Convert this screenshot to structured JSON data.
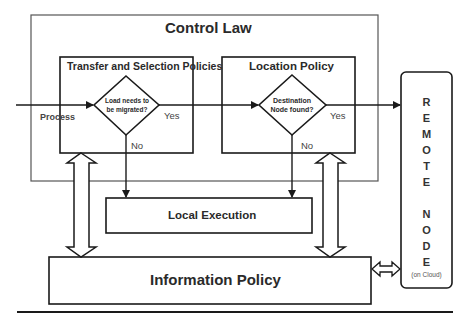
{
  "diagram": {
    "control_law": {
      "title": "Control Law"
    },
    "transfer_selection": {
      "title": "Transfer and Selection Policies",
      "decision": "Load needs to be migrated?",
      "yes_label": "Yes",
      "no_label": "No"
    },
    "location_policy": {
      "title": "Location Policy",
      "decision": "Destination Node found?",
      "yes_label": "Yes",
      "no_label": "No"
    },
    "process_label": "Process",
    "local_execution": {
      "title": "Local Execution"
    },
    "information_policy": {
      "title": "Information Policy"
    },
    "remote_node": {
      "letters": [
        "R",
        "E",
        "M",
        "O",
        "T",
        "E",
        "",
        "N",
        "O",
        "D",
        "E"
      ],
      "l0": "R",
      "l1": "E",
      "l2": "M",
      "l3": "O",
      "l4": "T",
      "l5": "E",
      "l6": "N",
      "l7": "O",
      "l8": "D",
      "l9": "E",
      "subtitle": "(on Cloud)"
    },
    "colors": {
      "line": "#1a1a1a",
      "outer_box": "#555555",
      "text": "#2a2a2a",
      "background": "#ffffff"
    }
  }
}
